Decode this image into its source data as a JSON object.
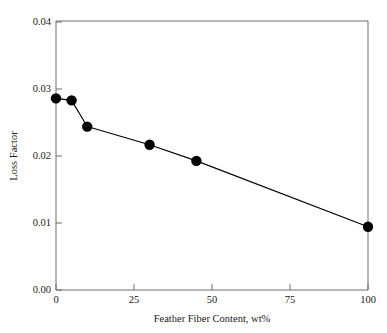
{
  "chart_data": {
    "type": "line",
    "title": "",
    "xlabel": "Feather Fiber Content, wt%",
    "ylabel": "Loss Factor",
    "xlim": [
      0,
      100
    ],
    "ylim": [
      0.0,
      0.04
    ],
    "xticks": [
      0,
      25,
      50,
      75,
      100
    ],
    "xtick_labels": [
      "0",
      "25",
      "50",
      "75",
      "100"
    ],
    "yticks": [
      0.0,
      0.01,
      0.02,
      0.03,
      0.04
    ],
    "ytick_labels": [
      "0.00",
      "0.01",
      "0.02",
      "0.03",
      "0.04"
    ],
    "grid": false,
    "legend": null,
    "marker": "filled-circle",
    "marker_color": "#000000",
    "line_color": "#000000",
    "frame_color": "#6f6f6f",
    "x": [
      0,
      5,
      10,
      30,
      45,
      100
    ],
    "values": [
      0.0285,
      0.0282,
      0.0243,
      0.0216,
      0.0192,
      0.0094
    ],
    "series": [
      {
        "name": "Loss Factor",
        "points": [
          {
            "x": 0,
            "y": 0.0285
          },
          {
            "x": 5,
            "y": 0.0282
          },
          {
            "x": 10,
            "y": 0.0243
          },
          {
            "x": 30,
            "y": 0.0216
          },
          {
            "x": 45,
            "y": 0.0192
          },
          {
            "x": 100,
            "y": 0.0094
          }
        ]
      }
    ]
  },
  "axes": {
    "x_title": "Feather Fiber Content, wt%",
    "y_title": "Loss Factor",
    "x_tick_0": "0",
    "x_tick_1": "25",
    "x_tick_2": "50",
    "x_tick_3": "75",
    "x_tick_4": "100",
    "y_tick_0": "0.00",
    "y_tick_1": "0.01",
    "y_tick_2": "0.02",
    "y_tick_3": "0.03",
    "y_tick_4": "0.04"
  }
}
